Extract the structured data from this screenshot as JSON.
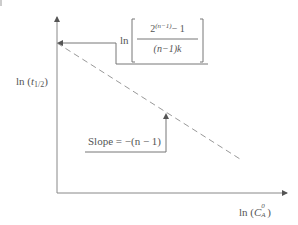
{
  "diagram": {
    "type": "log-log half-life plot",
    "y_axis": {
      "label_prefix": "ln (",
      "label_var": "t",
      "label_sub": "1/2",
      "label_suffix": ")"
    },
    "x_axis": {
      "label_prefix": "ln (",
      "label_var": "C",
      "label_sup": "0",
      "label_sub": "A",
      "label_suffix": ")"
    },
    "intercept_label": {
      "ln": "ln",
      "numerator_base": "2",
      "numerator_exp": "(n−1)",
      "numerator_rest": "− 1",
      "denominator": "(n−1)k"
    },
    "slope_label": {
      "text": "Slope = −(n − 1)"
    },
    "line": {
      "style": "dashed",
      "x1": 57,
      "y1": 43,
      "x2": 240,
      "y2": 159
    },
    "colors": {
      "stroke": "#777777",
      "text": "#555555"
    }
  }
}
